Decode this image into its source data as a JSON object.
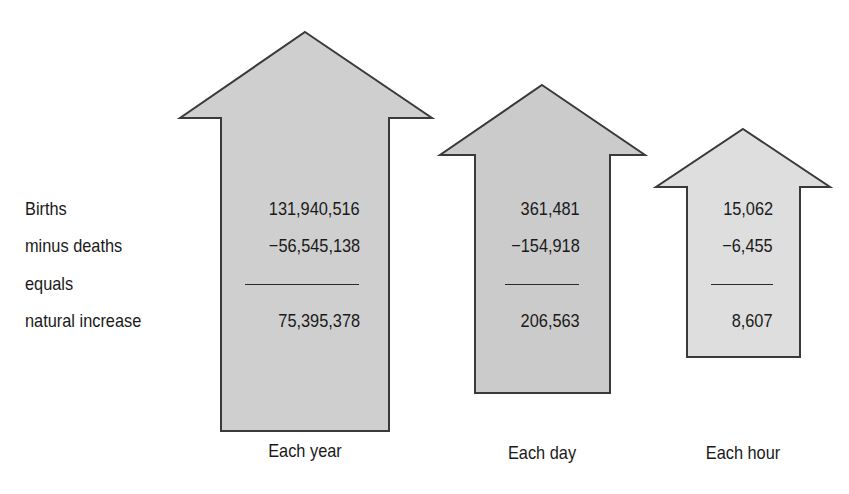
{
  "row_labels": {
    "births": "Births",
    "deaths": "minus deaths",
    "equals": "equals",
    "natural_increase": "natural increase"
  },
  "columns": [
    {
      "caption": "Each year",
      "births": "131,940,516",
      "deaths": "−56,545,138",
      "natural_increase": "75,395,378",
      "fill": "#cfcfcf"
    },
    {
      "caption": "Each day",
      "births": "361,481",
      "deaths": "−154,918",
      "natural_increase": "206,563",
      "fill": "#cbcbcb"
    },
    {
      "caption": "Each hour",
      "births": "15,062",
      "deaths": "−6,455",
      "natural_increase": "8,607",
      "fill": "#dedede"
    }
  ],
  "colors": {
    "arrow_stroke": "#3a3a3a",
    "text": "#1a1a1a",
    "background": "#ffffff"
  }
}
